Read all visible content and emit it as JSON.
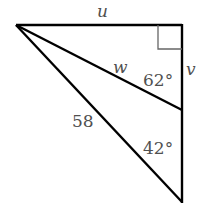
{
  "figure": {
    "type": "right-triangle-diagram",
    "vertices": {
      "top_left": [
        16,
        25
      ],
      "right_angle": [
        182,
        25
      ],
      "middle_right": [
        182,
        110
      ],
      "bottom_right": [
        182,
        202
      ]
    },
    "segments": [
      {
        "from": "top_left",
        "to": "right_angle",
        "label": "u"
      },
      {
        "from": "right_angle",
        "to": "bottom_right",
        "label": ""
      },
      {
        "from": "top_left",
        "to": "middle_right",
        "label": "w"
      },
      {
        "from": "top_left",
        "to": "bottom_right",
        "label": "58"
      }
    ],
    "right_angle_marker": {
      "at": "right_angle",
      "size": 24
    },
    "line_color": "#000000",
    "label_color": "#505050"
  },
  "labels": {
    "u": "u",
    "v": "v",
    "w": "w",
    "hypotenuse": "58",
    "angle_upper": "62°",
    "angle_lower": "42°"
  }
}
